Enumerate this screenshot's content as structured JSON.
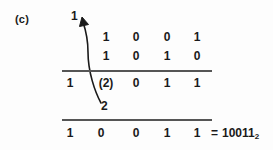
{
  "figure": {
    "part_label": "(c)",
    "carry_top": "1",
    "carry_bottom": "2",
    "addend_1": [
      "1",
      "0",
      "0",
      "1"
    ],
    "addend_2": [
      "1",
      "0",
      "1",
      "0"
    ],
    "intermediate": [
      "1",
      "(2)",
      "0",
      "1",
      "1"
    ],
    "final": [
      "1",
      "0",
      "0",
      "1",
      "1"
    ],
    "equals_sign": "=",
    "result_value": "10011",
    "result_base": "2",
    "rule_color": "#555555",
    "text_color": "#1a1a1a",
    "arrow_icon": "curved-carry-arrow-icon"
  }
}
